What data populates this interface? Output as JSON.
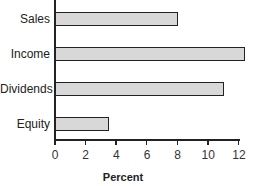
{
  "chart_data": {
    "type": "bar",
    "orientation": "horizontal",
    "title": "",
    "categories": [
      "Sales",
      "Income",
      "Dividends",
      "Equity"
    ],
    "values": [
      8.0,
      12.4,
      11.0,
      3.5
    ],
    "xlabel": "Percent",
    "ylabel": "",
    "xlim": [
      0,
      12
    ],
    "xticks": [
      "0",
      "2",
      "4",
      "6",
      "8",
      "10",
      "12"
    ],
    "grid": false,
    "legend": null,
    "bar_color": "#d8d8d8",
    "bar_edge_color": "#222222"
  }
}
